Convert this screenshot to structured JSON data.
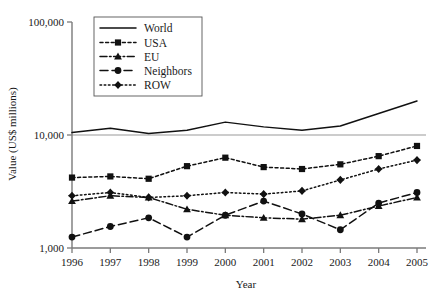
{
  "chart_data": {
    "type": "line",
    "title": "",
    "xlabel": "Year",
    "ylabel": "Value (US$ millions)",
    "yscale": "log",
    "ylim": [
      1000,
      100000
    ],
    "ytick_labels": [
      "100,000",
      "10,000",
      "1,000"
    ],
    "ytick_values": [
      100000,
      10000,
      1000
    ],
    "grid": false,
    "gridline_at": 10000,
    "legend_position": "top-center-inside",
    "categories": [
      "1996",
      "1997",
      "1998",
      "1999",
      "2000",
      "2001",
      "2002",
      "2003",
      "2004",
      "2005"
    ],
    "x": [
      1996,
      1997,
      1998,
      1999,
      2000,
      2001,
      2002,
      2003,
      2004,
      2005
    ],
    "series": [
      {
        "name": "World",
        "style": "solid",
        "marker": "none",
        "color": "#111111",
        "values": [
          10500,
          11500,
          10300,
          11000,
          13000,
          11800,
          11000,
          12000,
          15500,
          20000
        ]
      },
      {
        "name": "USA",
        "style": "dotted",
        "marker": "square",
        "color": "#111111",
        "values": [
          4200,
          4300,
          4100,
          5300,
          6300,
          5200,
          5000,
          5500,
          6500,
          8000
        ]
      },
      {
        "name": "EU",
        "style": "dashdot",
        "marker": "triangle",
        "color": "#111111",
        "values": [
          2600,
          2900,
          2800,
          2200,
          1950,
          1850,
          1800,
          1950,
          2350,
          2800
        ]
      },
      {
        "name": "Neighbors",
        "style": "dashed",
        "marker": "circle",
        "color": "#111111",
        "values": [
          1250,
          1550,
          1850,
          1250,
          1950,
          2600,
          2000,
          1450,
          2500,
          3100
        ]
      },
      {
        "name": "ROW",
        "style": "fine-dotted",
        "marker": "diamond",
        "color": "#111111",
        "values": [
          2900,
          3100,
          2800,
          2900,
          3100,
          3000,
          3200,
          4000,
          5000,
          6000
        ]
      }
    ]
  },
  "axes": {
    "y_title": "Value (US$ millions)",
    "x_title": "Year"
  },
  "legend": {
    "items": [
      {
        "label": "World"
      },
      {
        "label": "USA"
      },
      {
        "label": "EU"
      },
      {
        "label": "Neighbors"
      },
      {
        "label": "ROW"
      }
    ]
  }
}
